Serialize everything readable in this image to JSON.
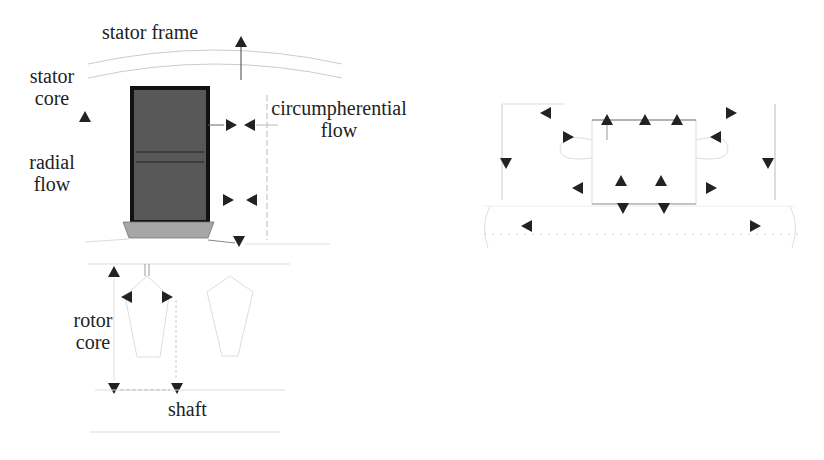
{
  "left_diagram": {
    "labels": {
      "stator_frame": "stator frame",
      "stator_core_line1": "stator",
      "stator_core_line2": "core",
      "radial_flow_line1": "radial",
      "radial_flow_line2": "flow",
      "circumferential_flow_line1": "circumpherential",
      "circumferential_flow_line2": "flow",
      "rotor_core_line1": "rotor",
      "rotor_core_line2": "core",
      "shaft": "shaft"
    }
  },
  "right_diagram": {
    "arrow_count": 16
  },
  "colors": {
    "ink": "#222222",
    "coil_fill": "#555555",
    "coil_border": "#111111",
    "wedge_fill": "#a6a6a6",
    "faint_line": "#cccccc"
  }
}
